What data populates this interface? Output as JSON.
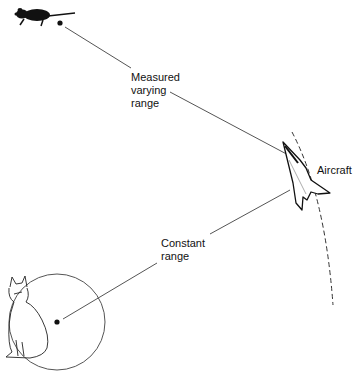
{
  "diagram": {
    "labels": {
      "measured": "Measured\nvarying\nrange",
      "constant": "Constant\nrange",
      "aircraft": "Aircraft"
    },
    "nodes": [
      {
        "id": "mouse",
        "icon": "mouse-icon",
        "dot": [
          60,
          23
        ]
      },
      {
        "id": "cat",
        "icon": "cat-icon",
        "dot": [
          57,
          322
        ]
      },
      {
        "id": "aircraft",
        "icon": "aircraft-icon",
        "position": [
          300,
          180
        ]
      }
    ],
    "edges": [
      {
        "from": "mouse",
        "to": "aircraft",
        "label": "measured"
      },
      {
        "from": "cat",
        "to": "aircraft",
        "label": "constant"
      }
    ],
    "colors": {
      "line": "#555555",
      "ink": "#111111",
      "background": "#ffffff"
    }
  }
}
